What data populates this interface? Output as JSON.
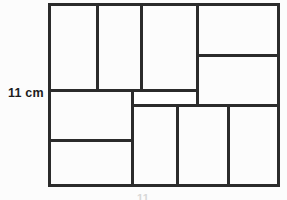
{
  "figure": {
    "kind": "squared-rectangle-tiling-diagram",
    "background_color": "#fcfcfc",
    "line_color": "#2b2b2b",
    "outer_frame": {
      "x": 48,
      "y": 3,
      "width": 232,
      "height": 183
    },
    "labels": {
      "height_dimension": {
        "text": "11 cm",
        "x": 8,
        "y": 86,
        "position": "left-of-figure",
        "color": "#1c1c1c"
      },
      "width_dimension": {
        "text": "11",
        "x": 137,
        "y": 192,
        "position": "below-figure-cropped",
        "color": "#d8d8d8"
      }
    },
    "tiles": [
      {
        "name": "tile-top-left",
        "x": 48,
        "y": 3,
        "width": 49,
        "height": 87
      },
      {
        "name": "tile-top-second",
        "x": 97,
        "y": 3,
        "width": 44,
        "height": 87
      },
      {
        "name": "tile-top-third",
        "x": 141,
        "y": 3,
        "width": 56,
        "height": 87
      },
      {
        "name": "tile-top-right",
        "x": 197,
        "y": 3,
        "width": 83,
        "height": 52
      },
      {
        "name": "tile-right-upper-mid",
        "x": 197,
        "y": 55,
        "width": 83,
        "height": 50
      },
      {
        "name": "tile-middle-left",
        "x": 48,
        "y": 90,
        "width": 84,
        "height": 50
      },
      {
        "name": "tile-middle-sliver",
        "x": 132,
        "y": 90,
        "width": 65,
        "height": 15,
        "highlight": true
      },
      {
        "name": "tile-bottom-left",
        "x": 48,
        "y": 140,
        "width": 84,
        "height": 46
      },
      {
        "name": "tile-bottom-second",
        "x": 132,
        "y": 105,
        "width": 45,
        "height": 81
      },
      {
        "name": "tile-bottom-third",
        "x": 177,
        "y": 105,
        "width": 51,
        "height": 81
      },
      {
        "name": "tile-bottom-right",
        "x": 228,
        "y": 105,
        "width": 52,
        "height": 81
      }
    ],
    "segments": [
      {
        "name": "outer-edge-top",
        "orientation": "horizontal",
        "x": 48,
        "y": 3,
        "length": 232,
        "thickness": 3
      },
      {
        "name": "outer-edge-bottom",
        "orientation": "horizontal",
        "x": 48,
        "y": 184,
        "length": 232,
        "thickness": 3
      },
      {
        "name": "outer-edge-left",
        "orientation": "vertical",
        "x": 48,
        "y": 3,
        "length": 184,
        "thickness": 3
      },
      {
        "name": "outer-edge-right",
        "orientation": "vertical",
        "x": 277,
        "y": 3,
        "length": 184,
        "thickness": 3
      },
      {
        "name": "divider-top-v1",
        "orientation": "vertical",
        "x": 96,
        "y": 3,
        "length": 89,
        "thickness": 3
      },
      {
        "name": "divider-top-v2",
        "orientation": "vertical",
        "x": 140,
        "y": 3,
        "length": 89,
        "thickness": 3
      },
      {
        "name": "divider-top-v3",
        "orientation": "vertical",
        "x": 196,
        "y": 3,
        "length": 103,
        "thickness": 3
      },
      {
        "name": "divider-right-h1",
        "orientation": "horizontal",
        "x": 196,
        "y": 54,
        "length": 84,
        "thickness": 3
      },
      {
        "name": "divider-middle-h1",
        "orientation": "horizontal",
        "x": 48,
        "y": 89,
        "length": 151,
        "thickness": 3
      },
      {
        "name": "divider-middle-h2",
        "orientation": "horizontal",
        "x": 132,
        "y": 104,
        "length": 148,
        "thickness": 3
      },
      {
        "name": "divider-middle-v1",
        "orientation": "vertical",
        "x": 131,
        "y": 89,
        "length": 96,
        "thickness": 3
      },
      {
        "name": "divider-bottom-h1",
        "orientation": "horizontal",
        "x": 48,
        "y": 139,
        "length": 85,
        "thickness": 3
      },
      {
        "name": "divider-bottom-v1",
        "orientation": "vertical",
        "x": 176,
        "y": 104,
        "length": 83,
        "thickness": 3
      },
      {
        "name": "divider-bottom-v2",
        "orientation": "vertical",
        "x": 227,
        "y": 104,
        "length": 83,
        "thickness": 3
      }
    ]
  }
}
